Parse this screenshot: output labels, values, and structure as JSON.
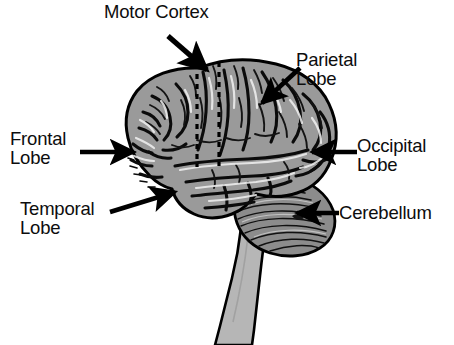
{
  "figure": {
    "width": 454,
    "height": 345,
    "background_color": "#ffffff"
  },
  "colors": {
    "cerebrum_fill": "#9a9a9a",
    "cerebellum_fill": "#8c8c8c",
    "brainstem_fill": "#b6b6b6",
    "outline": "#000000",
    "label_text": "#0d0d0d",
    "arrow": "#000000",
    "highlight": "#ffffff"
  },
  "labels": [
    {
      "id": "motor-cortex",
      "text": "Motor Cortex",
      "lines": [
        "Motor Cortex"
      ],
      "position": "top-center",
      "points_to": "motor-cortex-strip"
    },
    {
      "id": "parietal-lobe",
      "text": "Parietal\nLobe",
      "lines": [
        "Parietal",
        "Lobe"
      ],
      "position": "top-right",
      "points_to": "parietal-lobe-region"
    },
    {
      "id": "frontal-lobe",
      "text": "Frontal\nLobe",
      "lines": [
        "Frontal",
        "Lobe"
      ],
      "position": "left",
      "points_to": "frontal-lobe-region"
    },
    {
      "id": "occipital-lobe",
      "text": "Occipital\nLobe",
      "lines": [
        "Occipital",
        "Lobe"
      ],
      "position": "right",
      "points_to": "occipital-lobe-region"
    },
    {
      "id": "temporal-lobe",
      "text": "Temporal\nLobe",
      "lines": [
        "Temporal",
        "Lobe"
      ],
      "position": "bottom-left",
      "points_to": "temporal-lobe-region"
    },
    {
      "id": "cerebellum",
      "text": "Cerebellum",
      "lines": [
        "Cerebellum"
      ],
      "position": "bottom-right",
      "points_to": "cerebellum-region"
    }
  ],
  "structures": [
    {
      "id": "cerebrum",
      "name": "cerebrum",
      "fill": "#9a9a9a",
      "description": "Large convoluted cerebral hemisphere shown in lateral profile with gyri and sulci"
    },
    {
      "id": "cerebellum",
      "name": "cerebellum",
      "fill": "#8c8c8c",
      "description": "Rounded structure below and behind the cerebrum with horizontal folia striations"
    },
    {
      "id": "brainstem",
      "name": "brainstem",
      "fill": "#b6b6b6",
      "description": "Tapering column descending from the base of the brain toward the bottom edge"
    },
    {
      "id": "motor-cortex-strip",
      "name": "motor cortex strip",
      "style": "two vertical dashed black lines",
      "description": "Dashed boundary lines marking the motor cortex band on the superior cerebrum"
    }
  ],
  "annotations": {
    "arrow_count": 6,
    "arrow_style": "solid line with filled triangular head",
    "dashed_marker_count": 2
  }
}
